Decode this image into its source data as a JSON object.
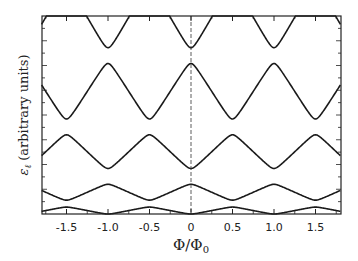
{
  "chart_data": {
    "type": "line",
    "title": "",
    "xlabel": "Φ/Φ0",
    "ylabel": "εℓ (arbitrary units)",
    "xlim": [
      -1.8,
      1.8
    ],
    "ylim": [
      0,
      1
    ],
    "x_ticks": [
      -1.5,
      -1.0,
      -0.5,
      0,
      0.5,
      1.0,
      1.5
    ],
    "x_tick_labels": [
      "-1.5",
      "-1.0",
      "-0.5",
      "0",
      "0.5",
      "1.0",
      "1.5"
    ],
    "grid": false,
    "legend": null,
    "dashed_vertical_line_at": 0,
    "series": [
      {
        "name": "band 1",
        "min_at": "integer",
        "min": 0.0,
        "max": 0.035
      },
      {
        "name": "band 2",
        "min_at": "half-integer",
        "min": 0.07,
        "max": 0.15
      },
      {
        "name": "band 3",
        "min_at": "integer",
        "min": 0.23,
        "max": 0.4
      },
      {
        "name": "band 4",
        "min_at": "half-integer",
        "min": 0.48,
        "max": 0.76
      },
      {
        "name": "band 5",
        "min_at": "integer",
        "min": 0.84,
        "max": 1.15
      }
    ]
  },
  "axes": {
    "xlabel_main": "Φ/Φ",
    "xlabel_sub": "0",
    "ylabel_symbol": "ε",
    "ylabel_sub": "ℓ",
    "ylabel_text": "(arbitrary units)"
  }
}
